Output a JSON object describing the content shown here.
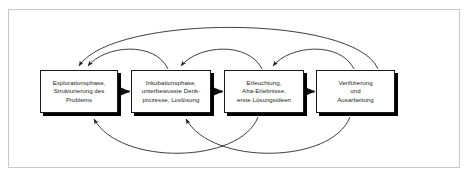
{
  "figure": {
    "background_color": "#ffffff",
    "frame_border_color": "#c9c9c9",
    "node_border_color": "#1a1a1a",
    "node_fill_color": "#ffffff",
    "node_shadow_color": "#000000",
    "arrow_color": "#1c1c1c"
  },
  "nodes": [
    {
      "id": "explorationsphase",
      "label": "Explorationsphase,\nStrukturierung des\nProblems"
    },
    {
      "id": "inkubationsphase",
      "label": "Inkubationsphase,\nunterbewusste Denk-\nprozesse, Loslösung"
    },
    {
      "id": "erleuchtung",
      "label": "Erleuchtung,\nAha-Erlebnisse,\nerste Lösungsideen"
    },
    {
      "id": "verifizierung",
      "label": "Verifizierung\nund\nAusarbeitung"
    }
  ],
  "connectors": {
    "forward": [
      {
        "id": "forward-1-2",
        "from": "explorationsphase",
        "to": "inkubationsphase"
      },
      {
        "id": "forward-2-3",
        "from": "inkubationsphase",
        "to": "erleuchtung"
      },
      {
        "id": "forward-3-4",
        "from": "erleuchtung",
        "to": "verifizierung"
      }
    ],
    "feedback_top": [
      {
        "id": "feedback-2-1",
        "from": "inkubationsphase",
        "to": "explorationsphase"
      },
      {
        "id": "feedback-3-2",
        "from": "erleuchtung",
        "to": "inkubationsphase"
      },
      {
        "id": "feedback-4-3",
        "from": "verifizierung",
        "to": "erleuchtung"
      },
      {
        "id": "feedback-4-1-long",
        "from": "verifizierung",
        "to": "explorationsphase"
      }
    ],
    "feedback_bottom": [
      {
        "id": "feedback-3-1-lower",
        "from": "erleuchtung",
        "to": "explorationsphase"
      },
      {
        "id": "feedback-4-2-lower",
        "from": "verifizierung",
        "to": "inkubationsphase"
      }
    ]
  }
}
